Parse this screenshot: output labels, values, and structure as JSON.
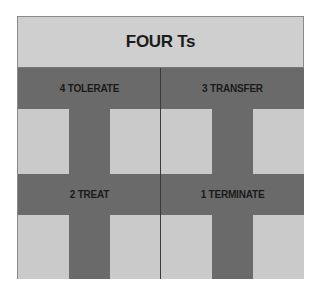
{
  "diagram": {
    "title": "FOUR Ts",
    "quadrants": [
      {
        "position": "top-left",
        "label": "4 TOLERATE"
      },
      {
        "position": "top-right",
        "label": "3 TRANSFER"
      },
      {
        "position": "bottom-left",
        "label": "2 TREAT"
      },
      {
        "position": "bottom-right",
        "label": "1 TERMINATE"
      }
    ],
    "colors": {
      "light": "#cacaca",
      "dark": "#6a6a6a",
      "text": "#1a1a1a"
    }
  }
}
